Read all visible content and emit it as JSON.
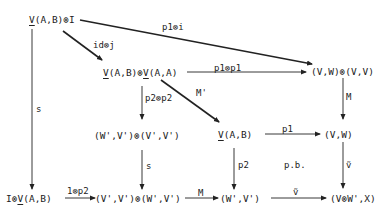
{
  "diagram": {
    "type": "commutative-diagram",
    "nodes": {
      "n1": {
        "pre_u": "V",
        "rest": "(A,B)⊗I"
      },
      "n2": {
        "pre_u": "V",
        "mid": "(A,B)⊗",
        "mid_u": "V",
        "rest": "(A,A)"
      },
      "n3": {
        "text": "(V,W)⊗(V,V)"
      },
      "n4": {
        "text": "(W',V')⊗(V',V')"
      },
      "n5": {
        "pre_u": "V",
        "rest": "(A,B)"
      },
      "n6": {
        "text": "(V,W)"
      },
      "n7": {
        "pre": "I⊗",
        "u": "V",
        "rest": "(A,B)"
      },
      "n8": {
        "text": "(V',V')⊗(W',V')"
      },
      "n9": {
        "text": "(W',V')"
      },
      "n10": {
        "text": "(V⊗W',X)"
      }
    },
    "edges": [
      {
        "from": "n1",
        "to": "n3",
        "label": "p1⊗i"
      },
      {
        "from": "n1",
        "to": "n2",
        "label": "id⊗j"
      },
      {
        "from": "n2",
        "to": "n3",
        "label": "p1⊗p1"
      },
      {
        "from": "n2",
        "to": "n4",
        "label": "p2⊗p2"
      },
      {
        "from": "n2",
        "to": "n5",
        "label": "M'"
      },
      {
        "from": "n3",
        "to": "n6",
        "label": "M"
      },
      {
        "from": "n1",
        "to": "n7",
        "label": "s"
      },
      {
        "from": "n4",
        "to": "n8",
        "label": "s"
      },
      {
        "from": "n5",
        "to": "n6",
        "label": "p1"
      },
      {
        "from": "n5",
        "to": "n9",
        "label": "p2"
      },
      {
        "from": "n6",
        "to": "n10",
        "label": "ṽ"
      },
      {
        "from": "n7",
        "to": "n8",
        "label": "1⊗p2"
      },
      {
        "from": "n8",
        "to": "n9",
        "label": "M"
      },
      {
        "from": "n9",
        "to": "n10",
        "label": "ṽ"
      }
    ],
    "annotations": {
      "pullback": "p.b."
    },
    "colors": {
      "ink": "#222222",
      "background": "#ffffff"
    }
  }
}
